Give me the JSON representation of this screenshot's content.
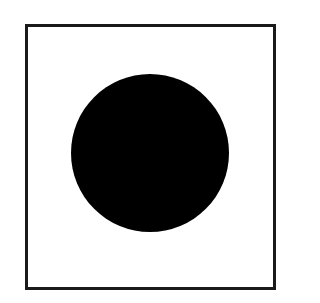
{
  "diagram": {
    "shapes": [
      {
        "type": "square-outline",
        "stroke_color": "#1a1a1a",
        "fill_color": "#ffffff"
      },
      {
        "type": "filled-circle",
        "fill_color": "#000000"
      }
    ]
  }
}
